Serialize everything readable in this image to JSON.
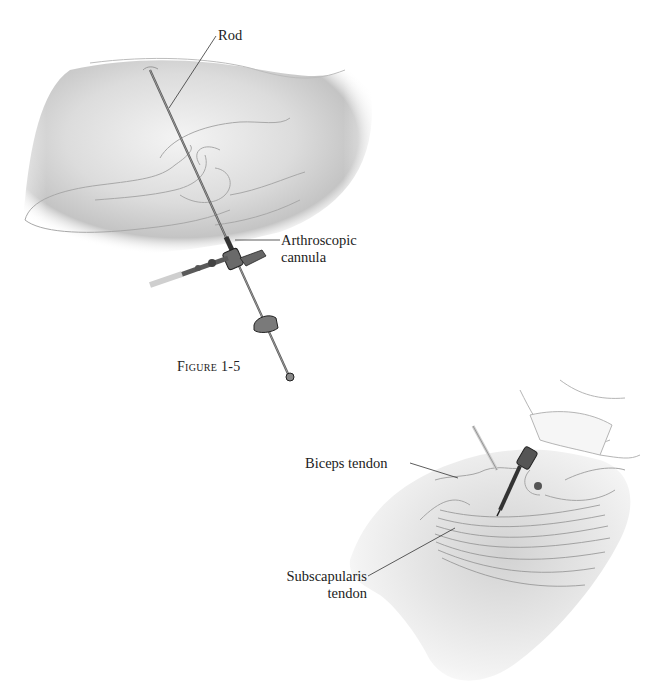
{
  "figure": {
    "caption_word": "Figure",
    "caption_number": "1-5"
  },
  "labels": {
    "rod": "Rod",
    "arthroscopic_cannula_line1": "Arthroscopic",
    "arthroscopic_cannula_line2": "cannula",
    "biceps_tendon": "Biceps tendon",
    "subscapularis_line1": "Subscapularis",
    "subscapularis_line2": "tendon"
  },
  "colors": {
    "background": "#ffffff",
    "skin_shade": "#cfcfcf",
    "outline": "#9a9a9a",
    "instrument": "#4a4a4a",
    "leader_line": "#333333"
  }
}
